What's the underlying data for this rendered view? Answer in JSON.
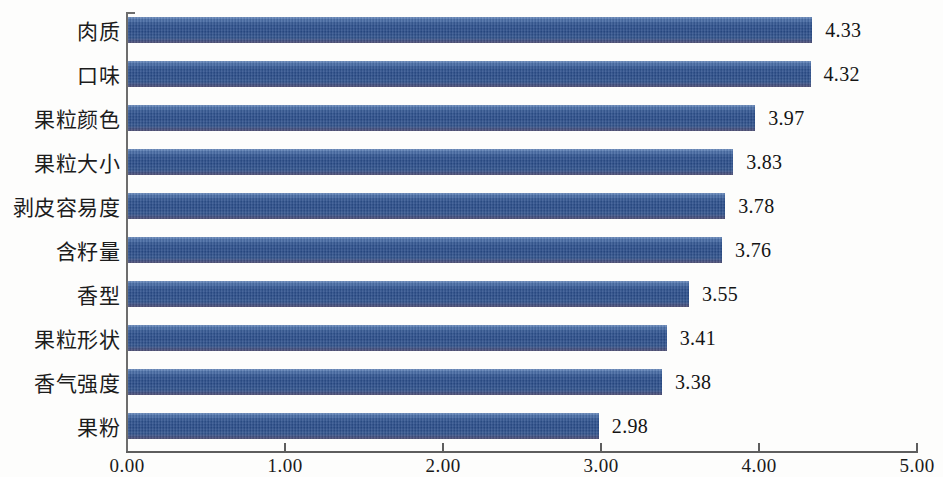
{
  "chart_data": {
    "type": "bar",
    "orientation": "horizontal",
    "title": "",
    "subtitle": "",
    "xlabel": "",
    "ylabel": "",
    "xlim": [
      0,
      5
    ],
    "xticks": [
      "0.00",
      "1.00",
      "2.00",
      "3.00",
      "4.00",
      "5.00"
    ],
    "xtick_values": [
      0,
      1,
      2,
      3,
      4,
      5
    ],
    "grid": false,
    "legend": null,
    "bar_color": "#2d5490",
    "categories": [
      "肉质",
      "口味",
      "果粒颜色",
      "果粒大小",
      "剥皮容易度",
      "含籽量",
      "香型",
      "果粒形状",
      "香气强度",
      "果粉"
    ],
    "values": [
      4.33,
      4.32,
      3.97,
      3.83,
      3.78,
      3.76,
      3.55,
      3.41,
      3.38,
      2.98
    ],
    "value_labels": [
      "4.33",
      "4.32",
      "3.97",
      "3.83",
      "3.78",
      "3.76",
      "3.55",
      "3.41",
      "3.38",
      "2.98"
    ]
  }
}
